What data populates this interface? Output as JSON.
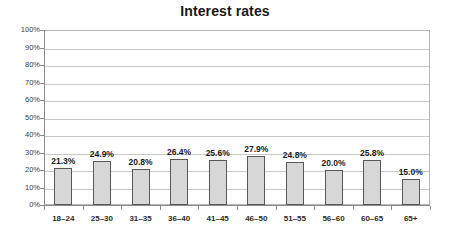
{
  "chart_data": {
    "type": "bar",
    "title": "Interest rates",
    "xlabel": "",
    "ylabel": "",
    "categories": [
      "18–24",
      "25–30",
      "31–35",
      "36–40",
      "41–45",
      "46–50",
      "51–55",
      "56–60",
      "60–65",
      "65+"
    ],
    "values": [
      21.3,
      24.9,
      20.8,
      26.4,
      25.6,
      27.9,
      24.8,
      20.0,
      25.8,
      15.0
    ],
    "value_labels": [
      "21.3%",
      "24.9%",
      "20.8%",
      "26.4%",
      "25.6%",
      "27.9%",
      "24.8%",
      "20.0%",
      "25.8%",
      "15.0%"
    ],
    "ylim": [
      0,
      100
    ],
    "y_tick_values": [
      100,
      90,
      80,
      70,
      60,
      50,
      40,
      30,
      20,
      10,
      0
    ],
    "y_tick_labels": [
      "100%",
      "90%",
      "80%",
      "70%",
      "60%",
      "50%",
      "40%",
      "30%",
      "20%",
      "10%",
      "0%"
    ],
    "grid": "horizontal",
    "legend": "none",
    "bar_fill_color": "#d7d7d7",
    "bar_border_color": "#585858",
    "gridline_color": "#c8c8c8",
    "axis_color": "#8c8c8c",
    "background_color": "#ffffff",
    "text_color": "#1a1a1a"
  }
}
